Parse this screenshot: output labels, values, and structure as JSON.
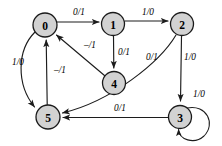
{
  "diagram": {
    "type": "finite-state-machine",
    "title": "",
    "colors": {
      "node_fill": "#d2d2d2",
      "node_stroke": "#1a1a1a",
      "edge_stroke": "#1c1c1c",
      "background": "#ffffff",
      "text": "#000000"
    },
    "nodes": [
      {
        "id": "0",
        "label": "0",
        "cx": 45,
        "cy": 25,
        "r": 12
      },
      {
        "id": "1",
        "label": "1",
        "cx": 113,
        "cy": 24,
        "r": 11.5
      },
      {
        "id": "2",
        "label": "2",
        "cx": 182,
        "cy": 24,
        "r": 11.5
      },
      {
        "id": "4",
        "label": "4",
        "cx": 114,
        "cy": 83,
        "r": 11.5
      },
      {
        "id": "5",
        "label": "5",
        "cx": 48,
        "cy": 117,
        "r": 12
      },
      {
        "id": "3",
        "label": "3",
        "cx": 180,
        "cy": 117,
        "r": 11.5
      }
    ],
    "edges": [
      {
        "from": "0",
        "to": "1",
        "label": "0/1",
        "label_x": 79,
        "label_y": 12
      },
      {
        "from": "1",
        "to": "2",
        "label": "1/0",
        "label_x": 148,
        "label_y": 12
      },
      {
        "from": "1",
        "to": "4",
        "label": "0/1",
        "label_x": 124,
        "label_y": 52
      },
      {
        "from": "4",
        "to": "0",
        "label": "–/1",
        "label_x": 90,
        "label_y": 45
      },
      {
        "from": "0",
        "to": "5",
        "label": "1/0",
        "label_x": 18,
        "label_y": 62
      },
      {
        "from": "5",
        "to": "0",
        "label": "–/1",
        "label_x": 60,
        "label_y": 70
      },
      {
        "from": "2",
        "to": "5",
        "label": "0/1",
        "label_x": 152,
        "label_y": 57
      },
      {
        "from": "2",
        "to": "3",
        "label": "1/0",
        "label_x": 190,
        "label_y": 57
      },
      {
        "from": "3",
        "to": "5",
        "label": "0/1",
        "label_x": 120,
        "label_y": 108
      },
      {
        "from": "3",
        "to": "3",
        "label": "1/0",
        "label_x": 199,
        "label_y": 94
      }
    ]
  }
}
